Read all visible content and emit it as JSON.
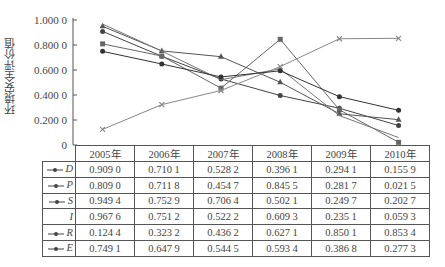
{
  "chart_data": {
    "type": "line",
    "title": "",
    "xlabel": "",
    "ylabel": "环境安全评价值",
    "ylim": [
      0,
      1.0
    ],
    "yticks": [
      "0",
      "0.200 0",
      "0.400 0",
      "0.600 0",
      "0.800 0",
      "1.000 0"
    ],
    "categories": [
      "2005年",
      "2006年",
      "2007年",
      "2008年",
      "2009年",
      "2010年"
    ],
    "grid": false,
    "legend_position": "table-left",
    "series": [
      {
        "name": "D",
        "marker": "diamond",
        "values": [
          0.909,
          0.7101,
          0.5282,
          0.3961,
          0.2941,
          0.1559
        ],
        "labels": [
          "0.909 0",
          "0.710 1",
          "0.528 2",
          "0.396 1",
          "0.294 1",
          "0.155 9"
        ]
      },
      {
        "name": "P",
        "marker": "square",
        "values": [
          0.809,
          0.7118,
          0.4547,
          0.8455,
          0.2817,
          0.0215
        ],
        "labels": [
          "0.809 0",
          "0.711 8",
          "0.454 7",
          "0.845 5",
          "0.281 7",
          "0.021 5"
        ]
      },
      {
        "name": "S",
        "marker": "triangle",
        "values": [
          0.9494,
          0.7529,
          0.7064,
          0.5021,
          0.2497,
          0.2027
        ],
        "labels": [
          "0.949 4",
          "0.752 9",
          "0.706 4",
          "0.502 1",
          "0.249 7",
          "0.202 7"
        ]
      },
      {
        "name": "I",
        "marker": "none",
        "values": [
          0.9676,
          0.7512,
          0.5222,
          0.6093,
          0.2351,
          0.0593
        ],
        "labels": [
          "0.967 6",
          "0.751 2",
          "0.522 2",
          "0.609 3",
          "0.235 1",
          "0.059 3"
        ]
      },
      {
        "name": "R",
        "marker": "x",
        "values": [
          0.1244,
          0.3232,
          0.4362,
          0.6271,
          0.8501,
          0.8534
        ],
        "labels": [
          "0.124 4",
          "0.323 2",
          "0.436 2",
          "0.627 1",
          "0.850 1",
          "0.853 4"
        ]
      },
      {
        "name": "E",
        "marker": "circle",
        "values": [
          0.7491,
          0.6479,
          0.5445,
          0.5934,
          0.3868,
          0.2773
        ],
        "labels": [
          "0.749 1",
          "0.647 9",
          "0.544 5",
          "0.593 4",
          "0.386 8",
          "0.277 3"
        ]
      }
    ]
  }
}
